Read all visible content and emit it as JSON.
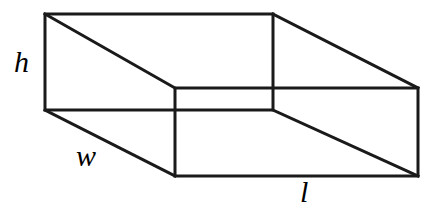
{
  "figure": {
    "name": "rectangular-box",
    "stroke_color": "#1a1a1a",
    "background_color": "#ffffff",
    "stroke_width": 3,
    "canvas": {
      "width": 438,
      "height": 210
    }
  },
  "labels": {
    "height": "h",
    "width": "w",
    "length": "l"
  },
  "geometry": {
    "back_face": {
      "name": "back-face",
      "points": "45,14 273,14 273,110 45,110"
    },
    "front_face": {
      "name": "front-face",
      "points": "175,88 418,88 418,176 175,176"
    },
    "connectors": [
      {
        "name": "edge-back-top-left-to-front-top-left",
        "x1": 45,
        "y1": 14,
        "x2": 175,
        "y2": 88
      },
      {
        "name": "edge-back-top-right-to-front-top-right",
        "x1": 273,
        "y1": 14,
        "x2": 418,
        "y2": 88
      },
      {
        "name": "edge-back-bottom-left-to-front-bottom-left",
        "x1": 45,
        "y1": 110,
        "x2": 175,
        "y2": 176
      },
      {
        "name": "edge-back-bottom-right-to-front-bottom-right",
        "x1": 273,
        "y1": 110,
        "x2": 418,
        "y2": 176
      }
    ]
  },
  "chart_data": {
    "type": "diagram",
    "title": "",
    "shape": "rectangular prism",
    "annotations": [
      "h",
      "w",
      "l"
    ],
    "vertices": {
      "back_top_left": [
        45,
        14
      ],
      "back_top_right": [
        273,
        14
      ],
      "back_bottom_left": [
        45,
        110
      ],
      "back_bottom_right": [
        273,
        110
      ],
      "front_top_left": [
        175,
        88
      ],
      "front_top_right": [
        418,
        88
      ],
      "front_bottom_left": [
        175,
        176
      ],
      "front_bottom_right": [
        418,
        176
      ]
    }
  }
}
